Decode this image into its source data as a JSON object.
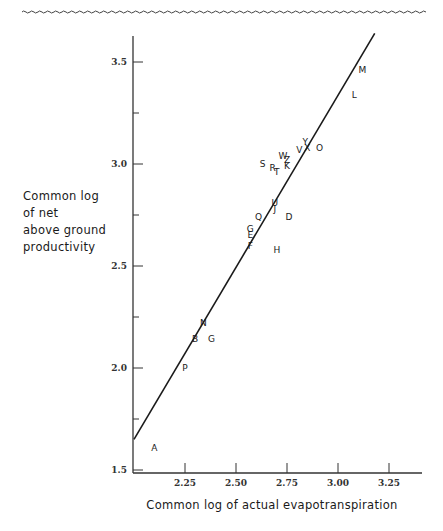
{
  "chart_data": {
    "type": "scatter",
    "title": "",
    "xlabel": "Common log of actual evapotranspiration",
    "ylabel_lines": [
      "Common log",
      "of net",
      "above ground",
      "productivity"
    ],
    "xlim": [
      2.0,
      3.4
    ],
    "ylim": [
      1.5,
      3.65
    ],
    "x_ticks": [
      {
        "value": 2.25,
        "label": "2.25"
      },
      {
        "value": 2.5,
        "label": "2.50"
      },
      {
        "value": 2.75,
        "label": "2.75"
      },
      {
        "value": 3.0,
        "label": "3.00"
      },
      {
        "value": 3.25,
        "label": "3.25"
      }
    ],
    "y_ticks": [
      {
        "value": 1.5,
        "label": "1.5"
      },
      {
        "value": 1.75,
        "label": ""
      },
      {
        "value": 2.0,
        "label": "2.0"
      },
      {
        "value": 2.25,
        "label": ""
      },
      {
        "value": 2.5,
        "label": "2.5"
      },
      {
        "value": 2.75,
        "label": ""
      },
      {
        "value": 3.0,
        "label": "3.0"
      },
      {
        "value": 3.25,
        "label": ""
      },
      {
        "value": 3.5,
        "label": "3.5"
      }
    ],
    "grid": false,
    "legend": null,
    "points": [
      {
        "label": "A",
        "x": 2.1,
        "y": 1.61
      },
      {
        "label": "P",
        "x": 2.25,
        "y": 2.0
      },
      {
        "label": "B",
        "x": 2.3,
        "y": 2.14
      },
      {
        "label": "G",
        "x": 2.38,
        "y": 2.14
      },
      {
        "label": "N",
        "x": 2.34,
        "y": 2.22
      },
      {
        "label": "F",
        "x": 2.57,
        "y": 2.6
      },
      {
        "label": "E",
        "x": 2.57,
        "y": 2.65
      },
      {
        "label": "G",
        "x": 2.57,
        "y": 2.68
      },
      {
        "label": "H",
        "x": 2.7,
        "y": 2.58
      },
      {
        "label": "Q",
        "x": 2.61,
        "y": 2.74
      },
      {
        "label": "D",
        "x": 2.76,
        "y": 2.74
      },
      {
        "label": "J",
        "x": 2.69,
        "y": 2.78
      },
      {
        "label": "U",
        "x": 2.69,
        "y": 2.81
      },
      {
        "label": "S",
        "x": 2.63,
        "y": 3.0
      },
      {
        "label": "R",
        "x": 2.68,
        "y": 2.98
      },
      {
        "label": "T",
        "x": 2.7,
        "y": 2.96
      },
      {
        "label": "K",
        "x": 2.75,
        "y": 2.99
      },
      {
        "label": "Z",
        "x": 2.75,
        "y": 3.02
      },
      {
        "label": "W",
        "x": 2.73,
        "y": 3.04
      },
      {
        "label": "V",
        "x": 2.81,
        "y": 3.07
      },
      {
        "label": "X",
        "x": 2.85,
        "y": 3.08
      },
      {
        "label": "Y",
        "x": 2.84,
        "y": 3.11
      },
      {
        "label": "O",
        "x": 2.91,
        "y": 3.08
      },
      {
        "label": "L",
        "x": 3.08,
        "y": 3.34
      },
      {
        "label": "M",
        "x": 3.12,
        "y": 3.46
      }
    ],
    "regression_line": {
      "x1": 2.0,
      "y1": 1.65,
      "x2": 3.18,
      "y2": 3.64
    }
  },
  "colors": {
    "ink": "#1a1a1a",
    "background": "#ffffff"
  }
}
